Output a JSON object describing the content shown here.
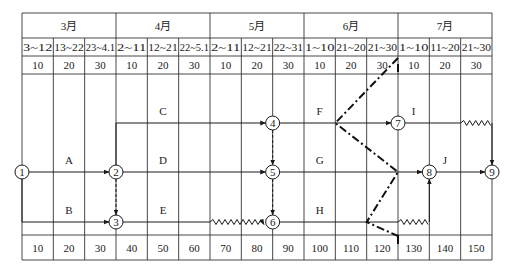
{
  "header": {
    "months": [
      {
        "label": "3月",
        "span": 3
      },
      {
        "label": "4月",
        "span": 3
      },
      {
        "label": "5月",
        "span": 3
      },
      {
        "label": "6月",
        "span": 3
      },
      {
        "label": "7月",
        "span": 3
      }
    ],
    "date_ranges": [
      "3~12",
      "13~22",
      "23~4.1",
      "2~11",
      "12~21",
      "22~5.1",
      "2~11",
      "12~21",
      "22~31",
      "1~10",
      "21~20",
      "21~30",
      "1~10",
      "11~20",
      "21~30"
    ],
    "day_values": [
      "10",
      "20",
      "30",
      "10",
      "20",
      "30",
      "10",
      "20",
      "30",
      "10",
      "20",
      "30",
      "10",
      "20",
      "30"
    ]
  },
  "footer": {
    "cumulative_days": [
      "10",
      "20",
      "30",
      "40",
      "50",
      "60",
      "70",
      "80",
      "90",
      "100",
      "110",
      "120",
      "130",
      "140",
      "150"
    ]
  },
  "nodes": [
    {
      "id": "1",
      "label": "1",
      "day": 0,
      "row": "middle"
    },
    {
      "id": "2",
      "label": "2",
      "day": 30,
      "row": "middle"
    },
    {
      "id": "3",
      "label": "3",
      "day": 30,
      "row": "bottom"
    },
    {
      "id": "4",
      "label": "4",
      "day": 80,
      "row": "top"
    },
    {
      "id": "5",
      "label": "5",
      "day": 80,
      "row": "middle"
    },
    {
      "id": "6",
      "label": "6",
      "day": 80,
      "row": "bottom"
    },
    {
      "id": "7",
      "label": "7",
      "day": 120,
      "row": "top"
    },
    {
      "id": "8",
      "label": "8",
      "day": 130,
      "row": "middle"
    },
    {
      "id": "9",
      "label": "9",
      "day": 150,
      "row": "middle"
    }
  ],
  "activities": [
    {
      "label": "A",
      "from": "1",
      "to": "2",
      "type": "solid"
    },
    {
      "label": "B",
      "from": "1",
      "to": "3",
      "type": "solid"
    },
    {
      "label": "C",
      "from": "2",
      "to": "4",
      "type": "solid"
    },
    {
      "label": "D",
      "from": "2",
      "to": "5",
      "type": "solid"
    },
    {
      "label": "E",
      "from": "3",
      "to": "6",
      "type": "solid",
      "free_float": "wavy 60-80"
    },
    {
      "label": "F",
      "from": "4",
      "to": "7",
      "type": "solid"
    },
    {
      "label": "G",
      "from": "5",
      "to": "8",
      "type": "solid"
    },
    {
      "label": "H",
      "from": "6",
      "to": "8",
      "type": "solid",
      "free_float": "wavy 120-130"
    },
    {
      "label": "I",
      "from": "7",
      "to": "9",
      "type": "solid",
      "free_float": "wavy 140-150"
    },
    {
      "label": "J",
      "from": "8",
      "to": "9",
      "type": "solid"
    }
  ],
  "dummy_activities": [
    {
      "from": "2",
      "to": "3"
    },
    {
      "from": "4",
      "to": "5"
    },
    {
      "from": "5",
      "to": "6"
    }
  ],
  "progress_check_line": {
    "check_day": 120,
    "points": [
      {
        "day": 120,
        "row": "header"
      },
      {
        "day": 100,
        "row": "top"
      },
      {
        "day": 120,
        "row": "middle"
      },
      {
        "day": 110,
        "row": "bottom"
      },
      {
        "day": 120,
        "row": "footer"
      }
    ]
  }
}
